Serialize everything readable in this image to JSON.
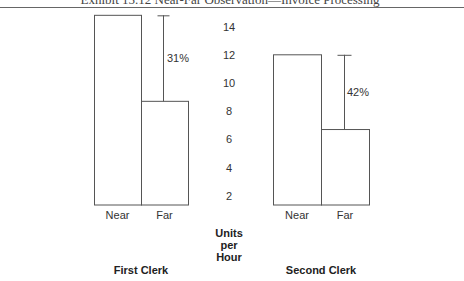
{
  "header": {
    "title": "Exhibit 15.12  Near-Far Observation—Invoice Processing"
  },
  "axis": {
    "label_lines": [
      "Units",
      "per",
      "Hour"
    ],
    "ticks": [
      2,
      4,
      6,
      8,
      10,
      12,
      14
    ]
  },
  "panels": [
    {
      "name": "First Clerk",
      "categories": [
        "Near",
        "Far"
      ],
      "values": [
        14.8,
        8.7
      ],
      "annotation": "31%"
    },
    {
      "name": "Second Clerk",
      "categories": [
        "Near",
        "Far"
      ],
      "values": [
        12,
        6.7
      ],
      "annotation": "42%"
    }
  ],
  "colors": {
    "line": "#555555",
    "text": "#333333",
    "background": "#ffffff"
  },
  "chart_data": [
    {
      "type": "bar",
      "title": "First Clerk",
      "categories": [
        "Near",
        "Far"
      ],
      "values": [
        14.8,
        8.7
      ],
      "annotations": [
        {
          "text": "31%",
          "description": "reduction from Near to Far"
        }
      ],
      "xlabel": "",
      "ylabel": "Units per Hour",
      "ylim": [
        0,
        15
      ],
      "yticks": [
        2,
        4,
        6,
        8,
        10,
        12,
        14
      ],
      "grid": false,
      "legend": null
    },
    {
      "type": "bar",
      "title": "Second Clerk",
      "categories": [
        "Near",
        "Far"
      ],
      "values": [
        12,
        6.7
      ],
      "annotations": [
        {
          "text": "42%",
          "description": "reduction from Near to Far"
        }
      ],
      "xlabel": "",
      "ylabel": "Units per Hour",
      "ylim": [
        0,
        15
      ],
      "yticks": [
        2,
        4,
        6,
        8,
        10,
        12,
        14
      ],
      "grid": false,
      "legend": null
    }
  ]
}
